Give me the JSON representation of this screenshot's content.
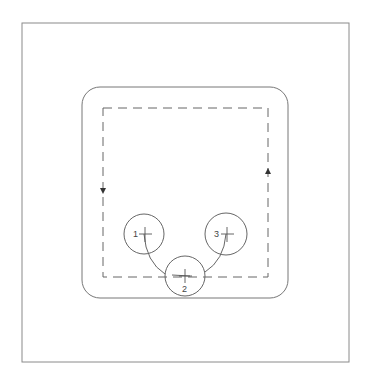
{
  "diagram": {
    "title": "",
    "colors": {
      "frame": "#8a8a8a",
      "track": "#777777",
      "path": "#666666",
      "circle": "#666666",
      "arc": "#555555",
      "label": "#444444"
    },
    "stations": [
      {
        "id": "station-1",
        "label": "1",
        "label_side": "left"
      },
      {
        "id": "station-2",
        "label": "2",
        "label_side": "bottom"
      },
      {
        "id": "station-3",
        "label": "3",
        "label_side": "left"
      }
    ],
    "path": {
      "style": "dashed",
      "direction": "clockwise",
      "arrows": [
        {
          "side": "left",
          "pointing": "down"
        },
        {
          "side": "right",
          "pointing": "up"
        }
      ]
    },
    "connections": [
      {
        "from": "1",
        "to": "2"
      },
      {
        "from": "2",
        "to": "3"
      }
    ]
  }
}
